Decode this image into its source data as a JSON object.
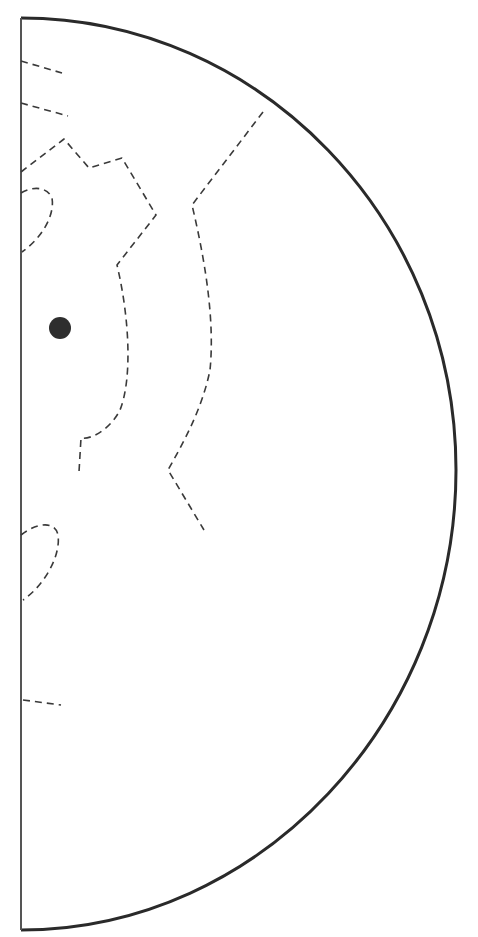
{
  "diagram": {
    "type": "half-disc contour diagram",
    "colors": {
      "background": "#ffffff",
      "outline": "#2a2a2a",
      "axis": "#555555",
      "contour": "#3a3a3a",
      "marker": "#2e2e2e"
    },
    "outline": {
      "straight_edge": {
        "x": 21,
        "y_top": 18,
        "y_bottom": 930
      },
      "arc_apex": {
        "x": 456,
        "y": 470
      }
    },
    "marker": {
      "cx": 60,
      "cy": 328,
      "r": 11
    },
    "contours": [
      {
        "name": "contour-tick-1",
        "points": "21,61 62,73"
      },
      {
        "name": "contour-tick-2",
        "points": "21,103 68,116"
      },
      {
        "name": "contour-inner",
        "points": "21,172 64,139 89,168 122,158 156,215 117,265 C 130,320 132,380 120,410 C 110,430 90,440 81,438 L 80,472"
      },
      {
        "name": "contour-loop-top",
        "points": "21,193 C 35,185 48,188 52,198 C 55,215 42,238 22,252"
      },
      {
        "name": "contour-outer",
        "points": "263,112 192,205 C 205,260 215,320 210,370 C 200,420 180,450 168,470 L 204,530"
      },
      {
        "name": "contour-loop-bottom",
        "points": "21,535 C 40,520 57,522 59,540 C 60,560 45,585 23,600"
      },
      {
        "name": "contour-tick-3",
        "points": "23,700 61,705"
      }
    ]
  }
}
